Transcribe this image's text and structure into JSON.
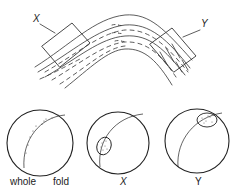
{
  "figure": {
    "fold": {
      "box_labels": [
        "X",
        "Y"
      ]
    },
    "stereonets": [
      {
        "id": "whole",
        "label_left": "whole",
        "label_right": "fold",
        "plot": "great-circle arc with scattered poles"
      },
      {
        "id": "x",
        "label": "X",
        "plot": "arc with stippled cluster at lower-left"
      },
      {
        "id": "y",
        "label": "Y",
        "plot": "arc with stippled cluster at upper-right"
      }
    ],
    "colors": {
      "ink": "#222222",
      "background": "#ffffff"
    }
  }
}
